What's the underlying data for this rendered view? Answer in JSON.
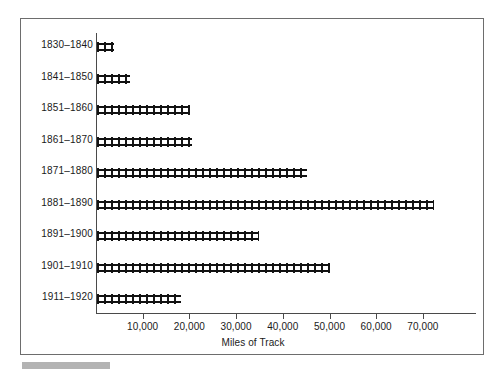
{
  "chart_data": {
    "type": "bar",
    "orientation": "horizontal",
    "title": "",
    "xlabel": "Miles of Track",
    "ylabel": "",
    "categories": [
      "1830–1840",
      "1841–1850",
      "1851–1860",
      "1861–1870",
      "1871–1880",
      "1881–1890",
      "1891–1900",
      "1901–1910",
      "1911–1920"
    ],
    "values": [
      3600,
      7100,
      20000,
      20400,
      45000,
      72200,
      34700,
      49900,
      18000
    ],
    "xlim": [
      0,
      78000
    ],
    "xticks": [
      10000,
      20000,
      30000,
      40000,
      50000,
      60000,
      70000
    ],
    "xticklabels": [
      "10,000",
      "20,000",
      "30,000",
      "40,000",
      "50,000",
      "60,000",
      "70,000"
    ],
    "grid": false,
    "legend": null,
    "bar_style": "railroad-track",
    "colors": {
      "bar": "#111111",
      "axis": "#4a4a4a",
      "frame": "#6d6d6d",
      "text": "#1a1a1a",
      "caption_swatch": "#b3b3b3",
      "background": "#ffffff"
    }
  },
  "figure": {
    "caption_swatch_label": ""
  }
}
